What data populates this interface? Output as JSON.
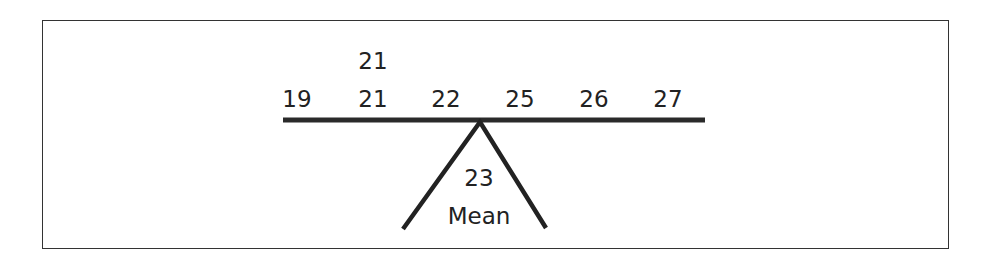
{
  "diagram": {
    "type": "balance-beam",
    "values": [
      {
        "label": "19",
        "x": 297,
        "y": 88
      },
      {
        "label": "21",
        "x": 373,
        "y": 88
      },
      {
        "label": "21",
        "x": 373,
        "y": 50
      },
      {
        "label": "22",
        "x": 446,
        "y": 88
      },
      {
        "label": "25",
        "x": 520,
        "y": 88
      },
      {
        "label": "26",
        "x": 594,
        "y": 88
      },
      {
        "label": "27",
        "x": 668,
        "y": 88
      }
    ],
    "fulcrum": {
      "value_label": "23",
      "caption": "Mean"
    },
    "colors": {
      "ink": "#222222",
      "border": "#333333",
      "background": "#ffffff"
    }
  }
}
